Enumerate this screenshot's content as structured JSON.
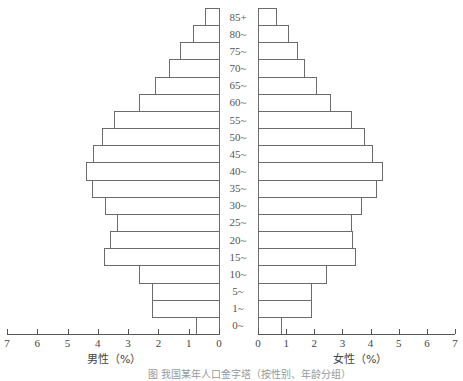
{
  "chart_data": {
    "type": "bar",
    "subtype": "population-pyramid",
    "title": "",
    "categories": [
      "85+",
      "80~",
      "75~",
      "70~",
      "65~",
      "60~",
      "55~",
      "50~",
      "45~",
      "40~",
      "35~",
      "30~",
      "25~",
      "20~",
      "15~",
      "10~",
      "5~",
      "1~",
      "0~"
    ],
    "series": [
      {
        "name": "男性（%）",
        "side": "left",
        "values": [
          0.45,
          0.85,
          1.3,
          1.65,
          2.1,
          2.65,
          3.45,
          3.85,
          4.15,
          4.4,
          4.2,
          3.75,
          3.35,
          3.6,
          3.8,
          2.65,
          2.2,
          2.2,
          0.75
        ]
      },
      {
        "name": "女性（%）",
        "side": "right",
        "values": [
          0.65,
          1.05,
          1.4,
          1.65,
          2.05,
          2.55,
          3.3,
          3.75,
          4.05,
          4.4,
          4.2,
          3.65,
          3.3,
          3.35,
          3.45,
          2.4,
          1.9,
          1.9,
          0.8
        ]
      }
    ],
    "xlabel_left": "男性（%）",
    "xlabel_right": "女性（%）",
    "xticks": [
      "0",
      "1",
      "2",
      "3",
      "4",
      "5",
      "6",
      "7"
    ],
    "xlim": [
      0,
      7
    ],
    "grid": false,
    "legend": "none"
  },
  "caption": "图  我国某年人口金字塔（按性别、年龄分组）"
}
